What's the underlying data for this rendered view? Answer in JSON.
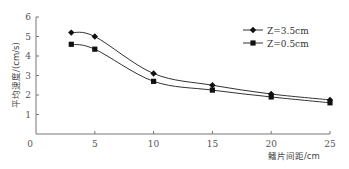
{
  "chart_data": {
    "type": "line",
    "title": "",
    "xlabel": "鳍片间距/cm",
    "ylabel": "平均速度/(cm/s)",
    "xlim": [
      0,
      25
    ],
    "ylim": [
      0,
      6
    ],
    "x_ticks": [
      "0",
      "5",
      "10",
      "15",
      "20",
      "25"
    ],
    "y_ticks": [
      "1",
      "2",
      "3",
      "4",
      "5",
      "6"
    ],
    "grid": false,
    "legend_position": "upper right",
    "x": [
      3,
      5,
      10,
      15,
      20,
      25
    ],
    "series": [
      {
        "name": "Z=3.5cm",
        "marker": "diamond",
        "values": [
          5.2,
          5.0,
          3.1,
          2.5,
          2.05,
          1.75
        ]
      },
      {
        "name": "Z=0.5cm",
        "marker": "square",
        "values": [
          4.6,
          4.35,
          2.7,
          2.25,
          1.9,
          1.6
        ]
      }
    ]
  },
  "colors": {
    "axis": "#777777",
    "line": "#333333",
    "marker": "#111111",
    "text": "#555555"
  }
}
